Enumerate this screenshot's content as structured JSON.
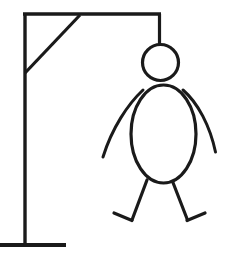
{
  "scene": {
    "title": "Hangman Drawing",
    "description": "Line drawing of a gallows with a hanged stick figure",
    "background_color": "#ffffff",
    "stroke_color": "#1a1a1a",
    "canvas": {
      "width": 226,
      "height": 255
    }
  },
  "gallows": {
    "label": "Gallows",
    "base": {
      "label": "Gallows base",
      "x1": 0,
      "y1": 245,
      "x2": 66,
      "y2": 245,
      "stroke_width": 4
    },
    "post": {
      "label": "Vertical post",
      "x1": 25,
      "y1": 13,
      "x2": 25,
      "y2": 246,
      "stroke_width": 3.4
    },
    "beam": {
      "label": "Horizontal beam",
      "x1": 23,
      "y1": 14,
      "x2": 161,
      "y2": 14,
      "stroke_width": 3.4
    },
    "brace": {
      "label": "Diagonal brace",
      "x1": 25,
      "y1": 73,
      "x2": 80,
      "y2": 15,
      "stroke_width": 3.2
    },
    "rope": {
      "label": "Rope",
      "x1": 159.5,
      "y1": 14,
      "x2": 159.5,
      "y2": 45,
      "stroke_width": 3.2
    }
  },
  "figure": {
    "label": "Hanged stick figure",
    "head": {
      "label": "Head",
      "cx": 160.5,
      "cy": 62.5,
      "r": 18,
      "stroke_width": 3.2
    },
    "body": {
      "label": "Body",
      "cx": 163.5,
      "cy": 134,
      "rx": 32.5,
      "ry": 49,
      "stroke_width": 3.2
    },
    "left_arm": {
      "label": "Left arm",
      "path": "M 143 90 C 128 104 112 128 103 157",
      "stroke_width": 3
    },
    "right_arm": {
      "label": "Right arm",
      "path": "M 183 90 C 198 103 210 126 215.5 152",
      "stroke_width": 3
    },
    "left_leg": {
      "label": "Left leg",
      "path": "M 147 180 L 132 220",
      "stroke_width": 3.2
    },
    "left_foot": {
      "label": "Left foot",
      "path": "M 132 220.5 L 114 213",
      "stroke_width": 3.2
    },
    "right_leg": {
      "label": "Right leg",
      "path": "M 172 180 L 187.5 220",
      "stroke_width": 3.2
    },
    "right_foot": {
      "label": "Right foot",
      "path": "M 187 220.5 L 205 213",
      "stroke_width": 3.2
    }
  }
}
